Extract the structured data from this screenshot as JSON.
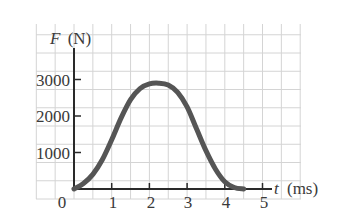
{
  "chart_data": {
    "type": "line",
    "title": "",
    "xlabel": "t (ms)",
    "ylabel": "F (N)",
    "xlabel_var": "t",
    "xlabel_unit": "(ms)",
    "ylabel_var": "F",
    "ylabel_unit": "(N)",
    "xlim": [
      0,
      5
    ],
    "ylim": [
      0,
      3000
    ],
    "grid": true,
    "legend": null,
    "x_ticks": [
      "0",
      "1",
      "2",
      "3",
      "4",
      "5"
    ],
    "y_ticks": [
      "1000",
      "2000",
      "3000"
    ],
    "series": [
      {
        "name": "F(t)",
        "color": "#555555",
        "x": [
          0,
          0.25,
          0.5,
          0.75,
          1.0,
          1.25,
          1.5,
          1.75,
          2.0,
          2.25,
          2.5,
          2.75,
          3.0,
          3.25,
          3.5,
          3.75,
          4.0,
          4.25,
          4.5
        ],
        "values": [
          0,
          150,
          400,
          800,
          1350,
          1950,
          2450,
          2750,
          2880,
          2900,
          2850,
          2650,
          2250,
          1650,
          1050,
          550,
          200,
          40,
          0
        ]
      }
    ]
  },
  "labels": {
    "origin": "0",
    "x1": "1",
    "x2": "2",
    "x3": "3",
    "x4": "4",
    "x5": "5",
    "y1": "1000",
    "y2": "2000",
    "y3": "3000",
    "ylabel_var": "F",
    "ylabel_unit": "(N)",
    "xlabel_var": "t",
    "xlabel_unit": "(ms)"
  },
  "colors": {
    "grid": "#d4d4d4",
    "axis": "#2a2a2a",
    "curve": "#555555",
    "text": "#3a3a3a"
  }
}
